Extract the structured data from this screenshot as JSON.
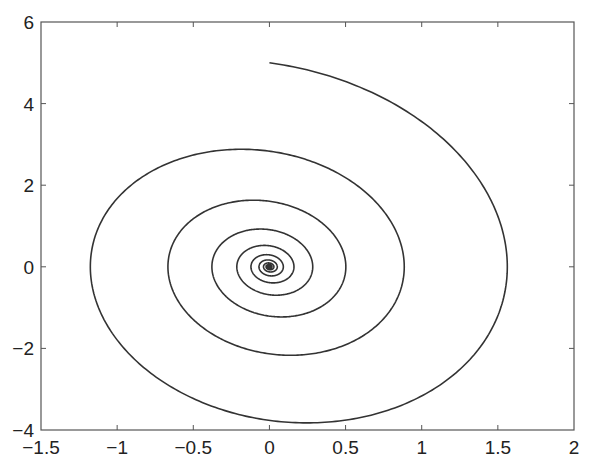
{
  "chart_data": {
    "type": "line",
    "title": "",
    "xlabel": "",
    "ylabel": "",
    "xlim": [
      -1.5,
      2
    ],
    "ylim": [
      -4,
      6
    ],
    "grid": false,
    "legend": null,
    "x_ticks": [
      "-1.5",
      "-1",
      "-0.5",
      "0",
      "0.5",
      "1",
      "1.5",
      "2"
    ],
    "y_ticks": [
      "-4",
      "-2",
      "0",
      "2",
      "4",
      "6"
    ],
    "x_tick_values": [
      -1.5,
      -1,
      -0.5,
      0,
      0.5,
      1,
      1.5,
      2
    ],
    "y_tick_values": [
      -4,
      -2,
      0,
      2,
      4,
      6
    ],
    "series": [
      {
        "name": "phase-trajectory",
        "description": "Damped oscillator phase-plane spiral, clockwise inward to origin",
        "start": [
          0,
          5
        ],
        "end": [
          0,
          0
        ],
        "model": {
          "omega": 2.8,
          "zeta": 0.09,
          "x0": 0,
          "y0": 5,
          "t_end": 25,
          "steps": 4000
        },
        "extrema": [
          {
            "label": "start",
            "x": 0.0,
            "y": 5.0
          },
          {
            "label": "right",
            "x": 1.55,
            "y": 0.1
          },
          {
            "label": "bottom",
            "x": 0.2,
            "y": -3.82
          },
          {
            "label": "left",
            "x": -1.13,
            "y": 0.0
          },
          {
            "label": "top",
            "x": -0.19,
            "y": 3.04
          },
          {
            "label": "right",
            "x": 0.84,
            "y": 0.0
          },
          {
            "label": "bottom",
            "x": 0.02,
            "y": -2.26
          },
          {
            "label": "left",
            "x": -0.65,
            "y": 0.0
          },
          {
            "label": "top",
            "x": -0.05,
            "y": 1.84
          },
          {
            "label": "right",
            "x": 0.5,
            "y": 0.0
          },
          {
            "label": "bottom",
            "x": 0.0,
            "y": -1.35
          },
          {
            "label": "left",
            "x": -0.39,
            "y": 0.0
          },
          {
            "label": "top",
            "x": 0.0,
            "y": 1.15
          },
          {
            "label": "right",
            "x": 0.3,
            "y": 0.0
          },
          {
            "label": "bottom",
            "x": 0.0,
            "y": -0.78
          },
          {
            "label": "right",
            "x": 0.18,
            "y": 0.0
          },
          {
            "label": "bottom",
            "x": 0.0,
            "y": -0.44
          }
        ]
      }
    ]
  },
  "style": {
    "line_color": "#333333",
    "axis_color": "#555555",
    "background": "#ffffff"
  }
}
